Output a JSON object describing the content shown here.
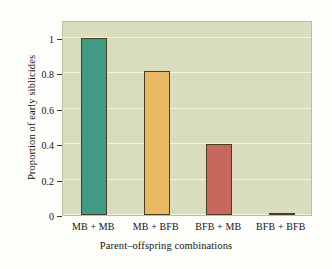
{
  "chart_data": {
    "type": "bar",
    "title": "",
    "categories": [
      "MB + MB",
      "MB + BFB",
      "BFB + MB",
      "BFB + BFB"
    ],
    "values": [
      1.0,
      0.81,
      0.4,
      0.01
    ],
    "xlabel": "Parent–offspring combinations",
    "ylabel": "Proportion of early siblicides",
    "ylim": [
      0,
      1.1
    ],
    "yticks": [
      0,
      0.2,
      0.4,
      0.6,
      0.8,
      1
    ],
    "ytick_labels": [
      "0",
      "0.2",
      "0.4",
      "0.6",
      "0.8",
      "1"
    ],
    "grid": true,
    "legend": "none",
    "bar_colors": [
      "#3f9b86",
      "#e9b963",
      "#c4695c",
      "#2d2a22"
    ],
    "bar_edge_color": "#4a3d23",
    "plot_background": "#d9ddbd",
    "gridline_color": "#f2f4e6",
    "figure_background": "#fdfdfa"
  }
}
